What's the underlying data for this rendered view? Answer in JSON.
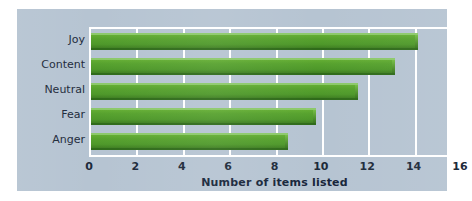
{
  "chart_data": {
    "type": "bar",
    "orientation": "horizontal",
    "title": "",
    "xlabel": "Number of items listed",
    "ylabel": "",
    "categories": [
      "Joy",
      "Content",
      "Neutral",
      "Fear",
      "Anger"
    ],
    "values": [
      14.1,
      13.1,
      11.5,
      9.7,
      8.5
    ],
    "series": [
      {
        "name": "Number of items listed",
        "values": [
          14.1,
          13.1,
          11.5,
          9.7,
          8.5
        ]
      }
    ],
    "xlim": [
      0,
      16
    ],
    "ylim": null,
    "xticks": [
      0,
      2,
      4,
      6,
      8,
      10,
      12,
      14,
      16
    ],
    "xticklabels": [
      "0",
      "2",
      "4",
      "6",
      "8",
      "10",
      "12",
      "14",
      "16"
    ],
    "grid": "vertical-white-gridlines",
    "legend": null,
    "legend_position": "none",
    "colors": {
      "bar": "#55a02e",
      "bar_highlight": "#8cc96a",
      "bar_shadow": "#2f6b1a",
      "panel_background": "#b6c4d2",
      "figure_background": "#ffffff",
      "gridline": "#ffffff",
      "text": "#1d2a3a"
    }
  }
}
